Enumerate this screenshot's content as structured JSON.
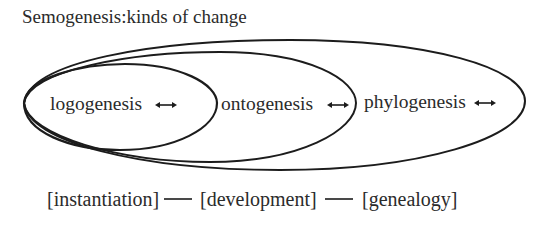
{
  "title": "Semogenesis:kinds of change",
  "nodes": [
    {
      "id": "logogenesis",
      "label": "logogenesis",
      "icon": "double-arrow-icon",
      "level": "inner"
    },
    {
      "id": "ontogenesis",
      "label": "ontogenesis",
      "icon": "double-arrow-icon",
      "level": "middle"
    },
    {
      "id": "phylogenesis",
      "label": "phylogenesis",
      "icon": "double-arrow-icon",
      "level": "outer"
    }
  ],
  "scale": {
    "items": [
      "[instantiation]",
      "[development]",
      "[genealogy]"
    ],
    "connector": "—"
  },
  "colors": {
    "stroke": "#1c1c1c",
    "text": "#2b2b2b",
    "background": "#ffffff"
  }
}
